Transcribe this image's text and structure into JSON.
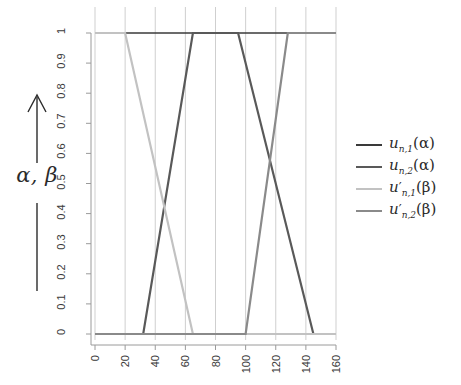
{
  "axis_annotation": {
    "label": "α, β",
    "arrow_icon": "up-arrow-icon"
  },
  "legend": {
    "entries": [
      {
        "name": "u_n1_alpha",
        "label_base": "u",
        "sub": "n,1",
        "prime": "",
        "arg": "(α)",
        "color": "#3a3a3a"
      },
      {
        "name": "u_n2_alpha",
        "label_base": "u",
        "sub": "n,2",
        "prime": "",
        "arg": "(α)",
        "color": "#595959"
      },
      {
        "name": "u_n1_beta",
        "label_base": "u",
        "sub": "n,1",
        "prime": "′",
        "arg": "(β)",
        "color": "#c2c2c2"
      },
      {
        "name": "u_n2_beta",
        "label_base": "u",
        "sub": "n,2",
        "prime": "′",
        "arg": "(β)",
        "color": "#8a8a8a"
      }
    ]
  },
  "chart_data": {
    "type": "line",
    "title": "",
    "xlabel": "",
    "ylabel": "α, β",
    "xlim": [
      0,
      160
    ],
    "ylim": [
      0,
      1
    ],
    "xticks": [
      0,
      20,
      40,
      60,
      80,
      100,
      120,
      140,
      160
    ],
    "xticklabels": [
      "0",
      "20",
      "40",
      "60",
      "80",
      "100",
      "120",
      "140",
      "160"
    ],
    "yticks": [
      0,
      0.1,
      0.2,
      0.3,
      0.4,
      0.5,
      0.6,
      0.7,
      0.8,
      0.9,
      1
    ],
    "yticklabels": [
      "0",
      "0.1",
      "0.2",
      "0.3",
      "0.4",
      "0.5",
      "0.6",
      "0.7",
      "0.8",
      "0.9",
      "1"
    ],
    "grid": "vertical",
    "legend_position": "right",
    "series": [
      {
        "name": "u_n1_alpha",
        "label": "u_{n,1}(α)",
        "color": "#3a3a3a",
        "width": 1.6,
        "points": [
          [
            0,
            1
          ],
          [
            160,
            1
          ]
        ]
      },
      {
        "name": "u_n2_alpha",
        "label": "u_{n,2}(α)",
        "color": "#595959",
        "width": 2.2,
        "points": [
          [
            0,
            0
          ],
          [
            32,
            0
          ],
          [
            65,
            1
          ],
          [
            95,
            1
          ],
          [
            145,
            0
          ],
          [
            160,
            0
          ]
        ]
      },
      {
        "name": "u_n1_beta",
        "label": "u'_{n,1}(β)",
        "color": "#c2c2c2",
        "width": 2.2,
        "points": [
          [
            0,
            1
          ],
          [
            20,
            1
          ],
          [
            65,
            0
          ],
          [
            160,
            0
          ]
        ]
      },
      {
        "name": "u_n2_beta",
        "label": "u'_{n,2}(β)",
        "color": "#8a8a8a",
        "width": 2.2,
        "points": [
          [
            0,
            0
          ],
          [
            100,
            0
          ],
          [
            128,
            1
          ],
          [
            160,
            1
          ]
        ]
      }
    ]
  }
}
